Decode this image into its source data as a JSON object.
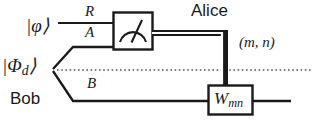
{
  "diagram": {
    "colors": {
      "wire": "#1a1a1a",
      "box_fill": "#ffffff",
      "background": "#ffffff",
      "dotted_line": "#555555"
    },
    "labels": {
      "input_state": "|φ⟩",
      "entangled_state_base": "|Φ",
      "entangled_state_sub": "d",
      "entangled_state_close": "⟩",
      "wire_R": "R",
      "wire_A": "A",
      "wire_B": "B",
      "party_alice": "Alice",
      "party_bob": "Bob",
      "measurement_outcome": "(m, n)"
    },
    "gates": [
      {
        "name": "measurement-gate",
        "symbol": "meter",
        "label": "",
        "x": 113,
        "y": 12,
        "width": 40,
        "height": 38
      },
      {
        "name": "correction-gate",
        "symbol": "unitary",
        "label_base": "W",
        "label_sub": "mn",
        "x": 208,
        "y": 85,
        "width": 45,
        "height": 30
      }
    ],
    "wires": [
      {
        "name": "wire-R-quantum",
        "type": "quantum",
        "label": "R",
        "y": 23
      },
      {
        "name": "wire-A-quantum",
        "type": "quantum",
        "label": "A",
        "y": 44
      },
      {
        "name": "wire-B-quantum",
        "type": "quantum",
        "label": "B",
        "y": 101
      },
      {
        "name": "wire-classical-mn",
        "type": "classical-double",
        "label": "(m, n)"
      },
      {
        "name": "separator-dotted",
        "type": "dotted",
        "y": 70
      }
    ]
  }
}
